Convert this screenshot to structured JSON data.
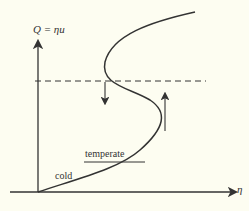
{
  "diagram": {
    "y_axis_label": "Q = ηu",
    "x_axis_label": "η",
    "labels": {
      "temperate": "temperate",
      "cold": "cold"
    },
    "colors": {
      "background": "#fdfdf1",
      "ink": "#333333"
    }
  }
}
